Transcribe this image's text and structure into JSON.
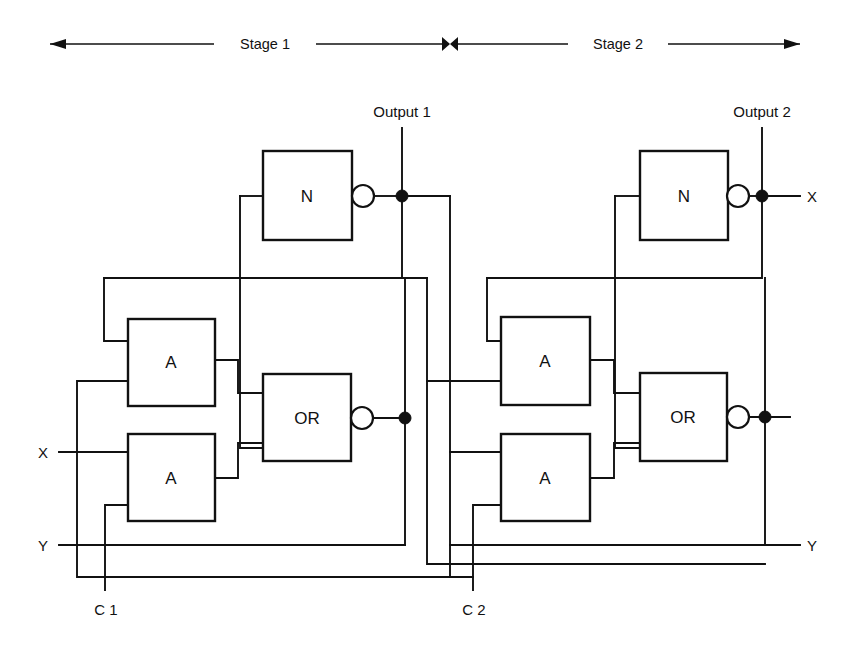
{
  "diagram": {
    "background_color": "#ffffff",
    "line_color": "#111111",
    "width": 859,
    "height": 659
  },
  "scale_bar": {
    "stage1_label": "Stage 1",
    "stage2_label": "Stage 2",
    "left_arrow_icon": "arrow-left-icon",
    "right_arrow_icon": "arrow-right-icon",
    "center_divider_icon": "double-arrow-icon"
  },
  "stage1": {
    "name": "Stage 1",
    "gates": [
      {
        "id": "s1-not",
        "label": "N",
        "type": "inverter",
        "inverted_output": true
      },
      {
        "id": "s1-and-top",
        "label": "A",
        "type": "and",
        "inverted_output": false
      },
      {
        "id": "s1-and-bottom",
        "label": "A",
        "type": "and",
        "inverted_output": false
      },
      {
        "id": "s1-or",
        "label": "OR",
        "type": "or",
        "inverted_output": true
      }
    ],
    "output_label": "Output 1",
    "clock_label": "C 1"
  },
  "stage2": {
    "name": "Stage 2",
    "gates": [
      {
        "id": "s2-not",
        "label": "N",
        "type": "inverter",
        "inverted_output": true
      },
      {
        "id": "s2-and-top",
        "label": "A",
        "type": "and",
        "inverted_output": false
      },
      {
        "id": "s2-and-bottom",
        "label": "A",
        "type": "and",
        "inverted_output": false
      },
      {
        "id": "s2-or",
        "label": "OR",
        "type": "or",
        "inverted_output": true
      }
    ],
    "output_label": "Output 2",
    "clock_label": "C 2",
    "feedback_label": "X",
    "feedback_label_bottom": "Y"
  },
  "inputs": {
    "x_label": "X",
    "y_label": "Y"
  }
}
